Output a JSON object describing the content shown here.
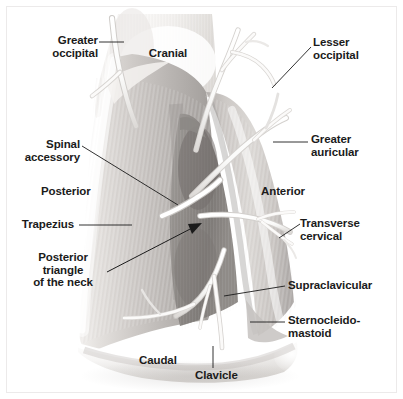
{
  "figure": {
    "background_color": "#ffffff",
    "frame_color": "#eceaea",
    "label_color": "#1b1b1b",
    "leader_line_color": "#1b1b1b"
  },
  "labels": {
    "greater_occipital": "Greater\noccipital",
    "cranial": "Cranial",
    "lesser_occipital": "Lesser\noccipital",
    "spinal_accessory": "Spinal\naccessory",
    "greater_auricular": "Greater\nauricular",
    "posterior": "Posterior",
    "anterior": "Anterior",
    "trapezius": "Trapezius",
    "transverse_cervical": "Transverse\ncervical",
    "posterior_triangle": "Posterior\ntriangle\nof the neck",
    "supraclavicular": "Supraclavicular",
    "sternocleidomastoid": "Sternocleido-\nmastoid",
    "caudal": "Caudal",
    "clavicle": "Clavicle"
  },
  "anatomy": {
    "muscles": [
      "Trapezius",
      "Sternocleidomastoid"
    ],
    "nerves": [
      "Greater occipital",
      "Lesser occipital",
      "Greater auricular",
      "Transverse cervical",
      "Supraclavicular",
      "Spinal accessory"
    ],
    "bones": [
      "Clavicle"
    ],
    "regions": [
      "Posterior triangle of the neck"
    ],
    "orientation_markers": [
      "Cranial",
      "Caudal",
      "Anterior",
      "Posterior"
    ]
  },
  "palette": {
    "trapezius_light": "#e8e6e4",
    "trapezius_mid": "#c9c6c3",
    "trapezius_shadow": "#a9a5a2",
    "triangle_dark": "#8e8a87",
    "triangle_darker": "#767270",
    "scm_light": "#dedbd8",
    "scm_mid": "#b8b4b1",
    "nerve_white": "#fdfdfc",
    "nerve_shade": "#d8d5d2",
    "clavicle_white": "#fbfbfa",
    "skin_highlight": "#f6f5f3"
  }
}
